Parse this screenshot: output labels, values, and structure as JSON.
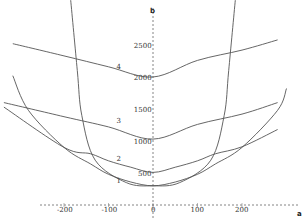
{
  "chart_data": {
    "type": "line",
    "title": "",
    "xlabel": "a",
    "ylabel": "b",
    "xlim": [
      -345,
      340
    ],
    "ylim": [
      -40,
      3200
    ],
    "grid": false,
    "x_ticks": [
      {
        "value": -200,
        "label": "-200"
      },
      {
        "value": -100,
        "label": "-100"
      },
      {
        "value": 0,
        "label": "0"
      },
      {
        "value": 100,
        "label": "100"
      },
      {
        "value": 200,
        "label": "200"
      }
    ],
    "y_ticks": [
      {
        "value": 500,
        "label": "500"
      },
      {
        "value": 1000,
        "label": "1000"
      },
      {
        "value": 1500,
        "label": "1500"
      },
      {
        "value": 2000,
        "label": "2000"
      },
      {
        "value": 2500,
        "label": "2500"
      }
    ],
    "series": [
      {
        "name": "1",
        "label": "1",
        "label_pos": [
          -100,
          350
        ],
        "points": [
          [
            -315,
            2020
          ],
          [
            -280,
            1480
          ],
          [
            -200,
            900
          ],
          [
            -140,
            640
          ],
          [
            -100,
            480
          ],
          [
            -50,
            360
          ],
          [
            0,
            300
          ],
          [
            50,
            360
          ],
          [
            100,
            480
          ],
          [
            140,
            640
          ],
          [
            200,
            900
          ],
          [
            280,
            1480
          ],
          [
            300,
            1820
          ]
        ]
      },
      {
        "name": "2",
        "label": "2",
        "label_pos": [
          -100,
          680
        ],
        "points": [
          [
            -335,
            1530
          ],
          [
            -200,
            900
          ],
          [
            -140,
            800
          ],
          [
            -100,
            690
          ],
          [
            -50,
            590
          ],
          [
            0,
            510
          ],
          [
            50,
            590
          ],
          [
            100,
            690
          ],
          [
            140,
            800
          ],
          [
            200,
            910
          ],
          [
            280,
            1180
          ]
        ]
      },
      {
        "name": "3",
        "label": "3",
        "label_pos": [
          -100,
          1280
        ],
        "points": [
          [
            -335,
            1600
          ],
          [
            -200,
            1380
          ],
          [
            -100,
            1220
          ],
          [
            0,
            1030
          ],
          [
            100,
            1260
          ],
          [
            200,
            1420
          ],
          [
            280,
            1600
          ]
        ]
      },
      {
        "name": "4",
        "label": "4",
        "label_pos": [
          -100,
          2130
        ],
        "points": [
          [
            -315,
            2520
          ],
          [
            -200,
            2330
          ],
          [
            -100,
            2160
          ],
          [
            0,
            2000
          ],
          [
            100,
            2260
          ],
          [
            200,
            2420
          ],
          [
            280,
            2580
          ]
        ]
      },
      {
        "name": "steep",
        "label": "",
        "points": [
          [
            -185,
            3200
          ],
          [
            -170,
            2100
          ],
          [
            -160,
            1400
          ],
          [
            -130,
            700
          ],
          [
            -60,
            350
          ],
          [
            0,
            300
          ],
          [
            60,
            350
          ],
          [
            130,
            700
          ],
          [
            160,
            1400
          ],
          [
            170,
            2100
          ],
          [
            185,
            3200
          ]
        ]
      }
    ]
  }
}
